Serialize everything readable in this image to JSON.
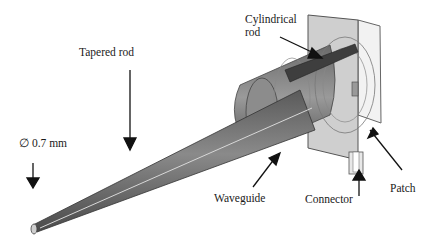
{
  "diagram": {
    "labels": {
      "tapered_rod": "Tapered rod",
      "cylindrical_rod_line1": "Cylindrical",
      "cylindrical_rod_line2": "rod",
      "diameter": "∅ 0.7 mm",
      "waveguide": "Waveguide",
      "connector": "Connector",
      "patch": "Patch"
    },
    "colors": {
      "rod_dark": "#4a4a4a",
      "rod_mid": "#7a7a7a",
      "rod_light": "#b5b5b5",
      "plate": "#c8c8c8",
      "text": "#1a1a1a"
    }
  }
}
